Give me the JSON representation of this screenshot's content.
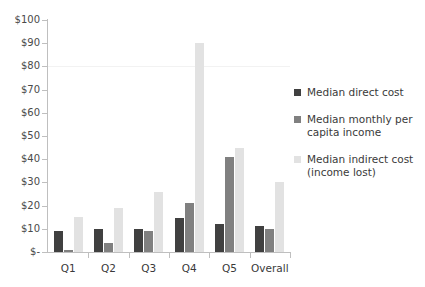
{
  "chart_data": {
    "type": "bar",
    "title": "",
    "subtitle": "",
    "xlabel": "",
    "ylabel": "",
    "categories": [
      "Q1",
      "Q2",
      "Q3",
      "Q4",
      "Q5",
      "Overall"
    ],
    "series": [
      {
        "name": "Median direct cost",
        "color": "#404040",
        "values": [
          9,
          10,
          10,
          14.5,
          12,
          11
        ]
      },
      {
        "name": "Median monthly per capita income",
        "color": "#808080",
        "values": [
          1,
          4,
          9,
          21,
          41,
          10
        ]
      },
      {
        "name": "Median indirect cost (income lost)",
        "color": "#e2e2e2",
        "values": [
          15,
          19,
          26,
          90,
          45,
          30
        ]
      }
    ],
    "ylim": [
      0,
      100
    ],
    "ytick_values": [
      0,
      10,
      20,
      30,
      40,
      50,
      60,
      70,
      80,
      90,
      100
    ],
    "ytick_labels": [
      "$-",
      "$10",
      "$20",
      "$30",
      "$40",
      "$50",
      "$60",
      "$70",
      "$80",
      "$90",
      "$100"
    ],
    "gridlines": [
      80
    ],
    "grid": false,
    "legend_position": "right",
    "legend_entries": [
      "Median direct cost",
      "Median monthly per capita income",
      "Median indirect cost (income lost)"
    ]
  },
  "colors": {
    "series_dark": "#404040",
    "series_medium": "#808080",
    "series_light": "#e2e2e2",
    "axis": "#bfbfbf",
    "gridline": "#f2f2f2",
    "text": "#3a3a3a",
    "background": "#ffffff"
  }
}
